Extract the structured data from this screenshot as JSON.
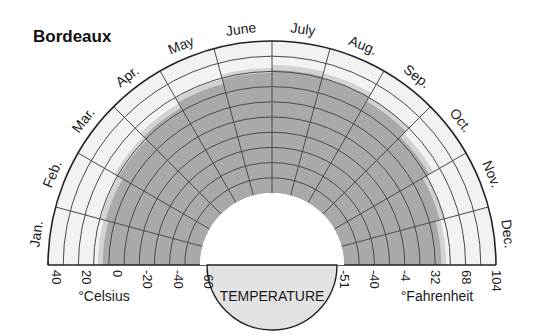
{
  "chart_data": {
    "type": "polar-area",
    "title": "Bordeaux",
    "xlabel": "TEMPERATURE",
    "categories": [
      "Jan.",
      "Feb.",
      "Mar.",
      "Apr.",
      "May",
      "June",
      "July",
      "Aug.",
      "Sep.",
      "Oct.",
      "Nov.",
      "Dec."
    ],
    "series": [
      {
        "name": "Monthly maximum temperature range (°C)",
        "values": [
          4,
          6,
          9,
          12,
          16,
          19,
          21,
          20,
          17,
          12,
          7,
          4
        ]
      }
    ],
    "radial_axis": {
      "celsius": {
        "label": "°Celsius",
        "ticks": [
          "40",
          "20",
          "0",
          "-20",
          "-40",
          "-60"
        ],
        "range": [
          -60,
          40
        ]
      },
      "fahrenheit": {
        "label": "°Fahrenheit",
        "ticks": [
          "-51",
          "-40",
          "-4",
          "32",
          "68",
          "104"
        ]
      }
    },
    "grid": true,
    "legend": "none"
  },
  "colors": {
    "band_fill": "#a9a9a9",
    "band_fringe": "#d2d2d2",
    "ring_fill": "#f2f2f2",
    "inner_fill": "#e2e2e2",
    "grid_line": "#4a4a4a",
    "outline": "#222222"
  }
}
